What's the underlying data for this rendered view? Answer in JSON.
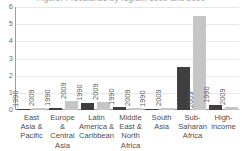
{
  "chart_data": {
    "type": "bar",
    "title": "Figure: Prevalence by region, 1990 and 2009",
    "xlabel": "",
    "ylabel": "",
    "ylim": [
      0,
      6
    ],
    "yticks": [
      6,
      5,
      4,
      3,
      2,
      1,
      0
    ],
    "grid": true,
    "legend_position": "none",
    "categories": [
      "East Asia & Pacific",
      "Europe & Central Asia",
      "Latin America & Caribbean",
      "Middle East & North Africa",
      "South Asia",
      "Sub-Saharan Africa",
      "High-income"
    ],
    "category_lines": [
      [
        "East",
        "Asia &",
        "Pacific"
      ],
      [
        "Europe &",
        "Central",
        "Asia"
      ],
      [
        "Latin",
        "America &",
        "Caribbean"
      ],
      [
        "Middle",
        "East &",
        "North",
        "Africa"
      ],
      [
        "South",
        "Asia"
      ],
      [
        "Sub-",
        "Saharan",
        "Africa"
      ],
      [
        "High-",
        "income"
      ]
    ],
    "series": [
      {
        "name": "1990",
        "color": "#3f3f3f",
        "values": [
          0.05,
          0.1,
          0.4,
          0.15,
          0.05,
          2.5,
          0.3
        ]
      },
      {
        "name": "2009",
        "color": "#c6c6c6",
        "values": [
          0.1,
          0.55,
          0.45,
          0.1,
          0.1,
          5.5,
          0.2
        ]
      }
    ]
  },
  "axis": {
    "y_tick_labels": [
      "6",
      "5",
      "4",
      "3",
      "2",
      "1",
      "0"
    ]
  }
}
